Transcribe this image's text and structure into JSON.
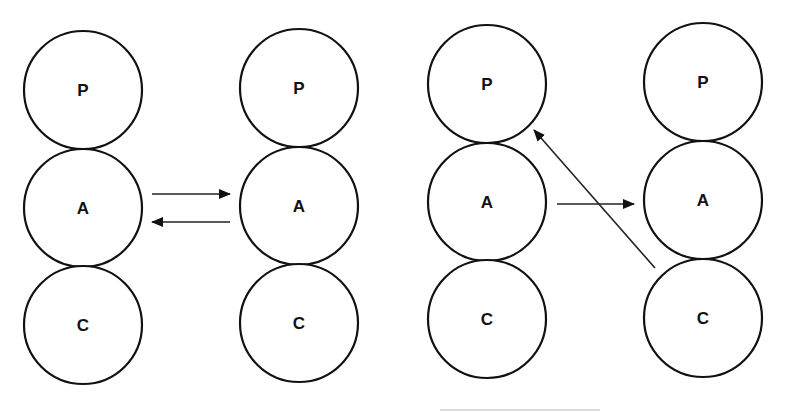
{
  "diagram": {
    "type": "node-transfer-diagram",
    "panels": [
      {
        "id": "left",
        "columns": [
          {
            "id": "left-col-1",
            "nodes": [
              {
                "label": "P",
                "cx": 83,
                "cy": 90
              },
              {
                "label": "A",
                "cx": 83,
                "cy": 208
              },
              {
                "label": "C",
                "cx": 83,
                "cy": 325
              }
            ]
          },
          {
            "id": "left-col-2",
            "nodes": [
              {
                "label": "P",
                "cx": 299,
                "cy": 88
              },
              {
                "label": "A",
                "cx": 299,
                "cy": 206
              },
              {
                "label": "C",
                "cx": 299,
                "cy": 323
              }
            ]
          }
        ],
        "arrows": [
          {
            "from": "A (left-col-1)",
            "to": "A (left-col-2)",
            "x1": 152,
            "y1": 194,
            "x2": 230,
            "y2": 194
          },
          {
            "from": "A (left-col-2)",
            "to": "A (left-col-1)",
            "x1": 230,
            "y1": 222,
            "x2": 152,
            "y2": 222
          }
        ]
      },
      {
        "id": "right",
        "columns": [
          {
            "id": "right-col-1",
            "nodes": [
              {
                "label": "P",
                "cx": 487,
                "cy": 84
              },
              {
                "label": "A",
                "cx": 487,
                "cy": 202
              },
              {
                "label": "C",
                "cx": 487,
                "cy": 319
              }
            ]
          },
          {
            "id": "right-col-2",
            "nodes": [
              {
                "label": "P",
                "cx": 703,
                "cy": 82
              },
              {
                "label": "A",
                "cx": 703,
                "cy": 200
              },
              {
                "label": "C",
                "cx": 703,
                "cy": 318
              }
            ]
          }
        ],
        "arrows": [
          {
            "from": "A (right-col-1)",
            "to": "A (right-col-2)",
            "x1": 557,
            "y1": 204,
            "x2": 634,
            "y2": 204
          },
          {
            "from": "C (right-col-2)",
            "to": "P (right-col-1)",
            "x1": 655,
            "y1": 268,
            "x2": 534,
            "y2": 130
          }
        ]
      }
    ],
    "node_radius": 59,
    "colors": {
      "stroke": "#111111",
      "background": "#ffffff"
    }
  }
}
